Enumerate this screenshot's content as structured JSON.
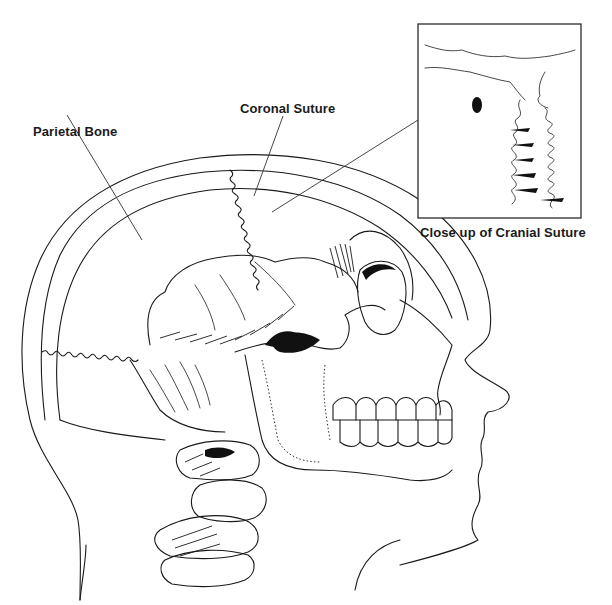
{
  "diagram": {
    "labels": {
      "parietal_bone": "Parietal Bone",
      "coronal_suture": "Coronal Suture",
      "inset_caption": "Close up of Cranial Suture"
    },
    "colors": {
      "line": "#1a1a1a",
      "background": "#ffffff"
    }
  }
}
